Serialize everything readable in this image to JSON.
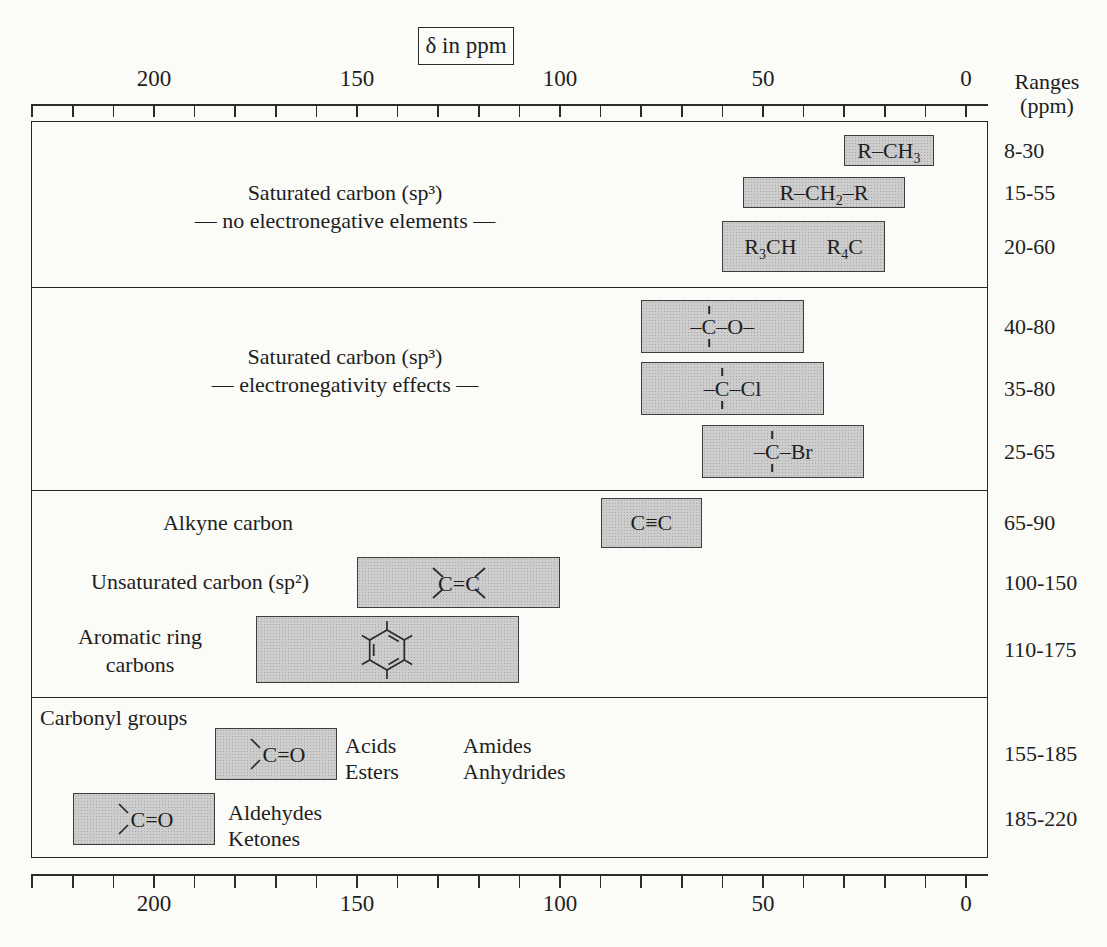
{
  "title_box": {
    "label": "δ in ppm"
  },
  "ranges_header": {
    "line1": "Ranges",
    "line2": "(ppm)"
  },
  "axis": {
    "unit": "ppm",
    "tick_min": 0,
    "tick_max": 230,
    "tick_step": 10,
    "labeled_ticks": [
      {
        "value": 200,
        "label": "200"
      },
      {
        "value": 150,
        "label": "150"
      },
      {
        "value": 100,
        "label": "100"
      },
      {
        "value": 50,
        "label": "50"
      },
      {
        "value": 0,
        "label": "0"
      }
    ]
  },
  "sections": [
    {
      "id": "sec1",
      "label_id": "sec1",
      "label_lines": [
        "Saturated carbon (sp³)",
        "— no electronegative elements —"
      ],
      "bars": [
        {
          "id": "r-ch3",
          "ppm_high": 30,
          "ppm_low": 8,
          "range_label": "8-30",
          "formula": [
            {
              "t": "R–CH"
            },
            {
              "t": "3",
              "sub": true
            }
          ]
        },
        {
          "id": "r-ch2-r",
          "ppm_high": 55,
          "ppm_low": 15,
          "range_label": "15-55",
          "formula": [
            {
              "t": "R–CH"
            },
            {
              "t": "2",
              "sub": true
            },
            {
              "t": "–R"
            }
          ]
        },
        {
          "id": "r3ch-r4c",
          "ppm_high": 60,
          "ppm_low": 20,
          "range_label": "20-60",
          "formula": [
            {
              "t": "R"
            },
            {
              "t": "3",
              "sub": true
            },
            {
              "t": "CH"
            },
            {
              "t": "R",
              "gap": true
            },
            {
              "t": "4",
              "sub": true
            },
            {
              "t": "C"
            }
          ]
        }
      ]
    },
    {
      "id": "sec2",
      "label_id": "sec2",
      "label_lines": [
        "Saturated carbon (sp³)",
        "— electronegativity effects —"
      ],
      "bars": [
        {
          "id": "c-o",
          "ppm_high": 80,
          "ppm_low": 40,
          "range_label": "40-80",
          "formula": [
            {
              "t": "–"
            },
            {
              "t": "C",
              "stack": true
            },
            {
              "t": "–O–"
            }
          ]
        },
        {
          "id": "c-cl",
          "ppm_high": 80,
          "ppm_low": 35,
          "range_label": "35-80",
          "formula": [
            {
              "t": "–"
            },
            {
              "t": "C",
              "stack": true
            },
            {
              "t": "–Cl"
            }
          ]
        },
        {
          "id": "c-br",
          "ppm_high": 65,
          "ppm_low": 25,
          "range_label": "25-65",
          "formula": [
            {
              "t": "–"
            },
            {
              "t": "C",
              "stack": true
            },
            {
              "t": "–Br"
            }
          ]
        }
      ]
    },
    {
      "id": "sec3",
      "rows": [
        {
          "label_id": "alkyne-label",
          "label_lines": [
            "Alkyne carbon"
          ],
          "bar": {
            "id": "alkyne",
            "ppm_high": 90,
            "ppm_low": 65,
            "range_label": "65-90",
            "formula": [
              {
                "t": "C≡C"
              }
            ]
          }
        },
        {
          "label_id": "alkene-label",
          "label_lines": [
            "Unsaturated carbon (sp²)"
          ],
          "bar": {
            "id": "alkene",
            "ppm_high": 150,
            "ppm_low": 100,
            "range_label": "100-150",
            "structure": "alkene",
            "structure_text": "C=C"
          }
        },
        {
          "label_id": "aromatic-label",
          "label_lines": [
            "Aromatic ring",
            "carbons"
          ],
          "bar": {
            "id": "aromatic",
            "ppm_high": 175,
            "ppm_low": 110,
            "range_label": "110-175",
            "structure": "benzene"
          }
        }
      ]
    },
    {
      "id": "sec4",
      "header": "Carbonyl groups",
      "rows": [
        {
          "bar": {
            "id": "carbonyl-acids",
            "ppm_high": 185,
            "ppm_low": 155,
            "range_label": "155-185",
            "structure": "carbonyl",
            "structure_text": "C=O"
          },
          "side_texts": [
            {
              "id": "acids",
              "lines": [
                "Acids",
                "Esters"
              ]
            },
            {
              "id": "amides",
              "lines": [
                "Amides",
                "Anhydrides"
              ]
            }
          ]
        },
        {
          "bar": {
            "id": "carbonyl-ald",
            "ppm_high": 220,
            "ppm_low": 185,
            "range_label": "185-220",
            "structure": "carbonyl",
            "structure_text": "C=O"
          },
          "side_texts": [
            {
              "id": "aldehydes",
              "lines": [
                "Aldehydes",
                "Ketones"
              ]
            }
          ]
        }
      ]
    }
  ],
  "chart_data": {
    "type": "bar",
    "orientation": "horizontal-range",
    "title": "δ in ppm",
    "xlabel": "δ in ppm",
    "right_column_label": "Ranges (ppm)",
    "x_axis": {
      "min": 0,
      "max": 230,
      "reversed": true,
      "tick_step": 10,
      "labeled_ticks": [
        200,
        150,
        100,
        50,
        0
      ]
    },
    "series": [
      {
        "group": "Saturated carbon (sp³) — no electronegative elements",
        "label": "R–CH₃",
        "range_ppm": [
          8,
          30
        ]
      },
      {
        "group": "Saturated carbon (sp³) — no electronegative elements",
        "label": "R–CH₂–R",
        "range_ppm": [
          15,
          55
        ]
      },
      {
        "group": "Saturated carbon (sp³) — no electronegative elements",
        "label": "R₃CH, R₄C",
        "range_ppm": [
          20,
          60
        ]
      },
      {
        "group": "Saturated carbon (sp³) — electronegativity effects",
        "label": "–C–O–",
        "range_ppm": [
          40,
          80
        ]
      },
      {
        "group": "Saturated carbon (sp³) — electronegativity effects",
        "label": "–C–Cl",
        "range_ppm": [
          35,
          80
        ]
      },
      {
        "group": "Saturated carbon (sp³) — electronegativity effects",
        "label": "–C–Br",
        "range_ppm": [
          25,
          65
        ]
      },
      {
        "group": "Alkyne carbon",
        "label": "C≡C",
        "range_ppm": [
          65,
          90
        ]
      },
      {
        "group": "Unsaturated carbon (sp²)",
        "label": "C=C",
        "range_ppm": [
          100,
          150
        ]
      },
      {
        "group": "Aromatic ring carbons",
        "label": "benzene ring",
        "range_ppm": [
          110,
          175
        ]
      },
      {
        "group": "Carbonyl groups (Acids, Esters, Amides, Anhydrides)",
        "label": "C=O",
        "range_ppm": [
          155,
          185
        ]
      },
      {
        "group": "Carbonyl groups (Aldehydes, Ketones)",
        "label": "C=O",
        "range_ppm": [
          185,
          220
        ]
      }
    ]
  }
}
